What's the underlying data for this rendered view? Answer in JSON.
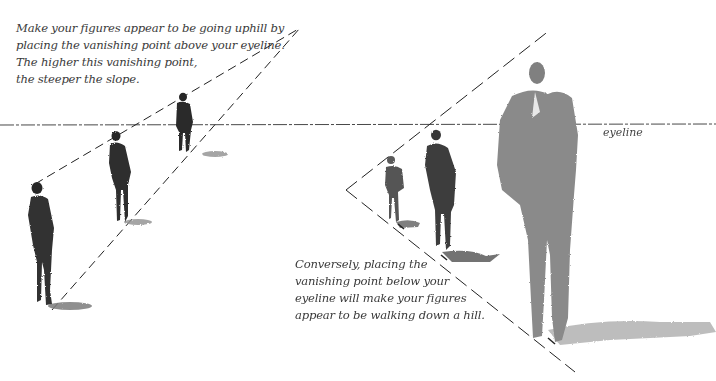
{
  "captions": {
    "uphill": {
      "lines": [
        "Make your figures appear to be going uphill by",
        "placing the vanishing point above your eyeline.",
        "The higher this vanishing point,",
        "the steeper the slope."
      ]
    },
    "downhill": {
      "lines": [
        "Conversely, placing the",
        "vanishing point below your",
        "eyeline will make your figures",
        "appear to be walking down a hill."
      ]
    },
    "eyeline_label": "eyeline"
  },
  "diagram": {
    "eyeline_y": 125,
    "uphill": {
      "vanishing_point": [
        300,
        28
      ],
      "figures": 3
    },
    "downhill": {
      "vanishing_point": [
        346,
        190
      ],
      "figures": 3
    },
    "colors": {
      "line": "#2a2a2a",
      "figure_dark": "#2b2b2b",
      "figure_mid": "#4a4a4a",
      "figure_light": "#8a8a8a",
      "shadow": "#9a9a9a"
    }
  }
}
